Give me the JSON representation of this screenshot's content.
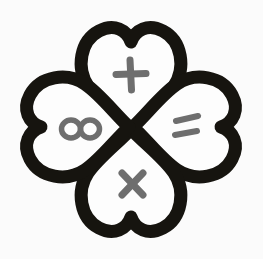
{
  "artwork": {
    "title": "Four-heart clover with math symbols",
    "description": "Hand-drawn four-leaf clover formed by four hearts meeting at a central point",
    "background_color": "#fbfbfb",
    "outline_color": "#16140f",
    "petal_fill_color": "#fdfdfd",
    "symbol_color": "#6e6e6e",
    "outline_thickness": "13",
    "petal_count": "4"
  },
  "petals": [
    {
      "position": "top",
      "rotation_degrees": "0",
      "symbol_name": "plus-symbol",
      "symbol_glyph": "+",
      "symbol_meaning": "plus",
      "center_x": "131",
      "center_y": "75"
    },
    {
      "position": "right",
      "rotation_degrees": "90",
      "symbol_name": "equals-symbol",
      "symbol_glyph": "=",
      "symbol_meaning": "equals",
      "center_x": "188",
      "center_y": "127"
    },
    {
      "position": "bottom",
      "rotation_degrees": "180",
      "symbol_name": "multiply-symbol",
      "symbol_glyph": "×",
      "symbol_meaning": "multiply",
      "center_x": "133",
      "center_y": "184"
    },
    {
      "position": "left",
      "rotation_degrees": "270",
      "symbol_name": "infinity-symbol",
      "symbol_glyph": "∞",
      "symbol_meaning": "infinity",
      "center_x": "81",
      "center_y": "129"
    }
  ]
}
